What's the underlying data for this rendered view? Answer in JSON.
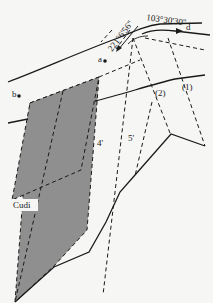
{
  "diagram": {
    "labels": {
      "bearing_a": "221°6'56\"",
      "bearing_d": "103°30'30\"",
      "point_a": "a",
      "point_b": "b",
      "point_d": "d",
      "zone_1": "(1)",
      "zone_2": "(2)",
      "line_4": "4'",
      "line_5": "5'",
      "formation": "Cudi"
    },
    "colors": {
      "background": "#f6f6f4",
      "line": "#1a1a1a",
      "shaded_area": "#8f8f8f"
    }
  }
}
